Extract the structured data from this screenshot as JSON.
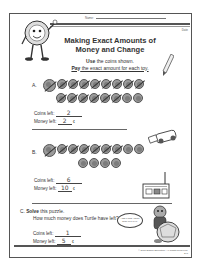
{
  "header": {
    "name_label": "Name:",
    "date_label": "Date",
    "title_line1": "Making Exact Amounts of",
    "title_line2": "Money and Change",
    "instruction_line1_bold": "Use",
    "instruction_line1_rest": " the coins shown.",
    "instruction_line2_bold": "Pay",
    "instruction_line2_rest": " the exact amount for each toy."
  },
  "sections": [
    {
      "label": "A.",
      "coins_row1": [
        "quarter",
        "nickel",
        "nickel",
        "nickel",
        "nickel",
        "nickel",
        "nickel",
        "nickel",
        "nickel"
      ],
      "coins_row2": [
        "nickel",
        "nickel",
        "nickel",
        "nickel",
        "nickel",
        "nickel",
        "nickel",
        "nickel"
      ],
      "coins_left_label": "Coins left:",
      "coins_left_value": "2",
      "money_left_label": "Money left:",
      "money_left_value": "2",
      "cent_symbol": "¢",
      "toy": "toy-car"
    },
    {
      "label": "B.",
      "coins_row1": [
        "quarter",
        "dime",
        "dime",
        "dime",
        "dime",
        "dime",
        "dime",
        "dime",
        "dime"
      ],
      "coins_row2": [
        "dime",
        "dime",
        "dime",
        "dime"
      ],
      "coins_left_label": "Coins left:",
      "coins_left_value": "6",
      "money_left_label": "Money left:",
      "money_left_value": "10",
      "cent_symbol": "¢",
      "toy": "toy-radio"
    },
    {
      "label": "C.",
      "prompt_bold": "Solve",
      "prompt_rest": " this puzzle.",
      "question": "How much money does Turtle have left?",
      "bubble_text": "I had 6 coins. I spent some on a yo-yo.",
      "coins_left_label": "Coins left:",
      "coins_left_value": "1",
      "money_left_label": "Money left:",
      "money_left_value": "5",
      "cent_symbol": "¢"
    }
  ],
  "footer": {
    "copyright": "© 2008 Edison Education. All Rights Reserved.",
    "page": "241"
  }
}
